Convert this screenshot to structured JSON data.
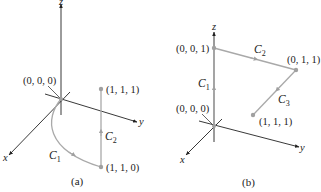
{
  "colors": {
    "axis": "#222222",
    "path": "#a9a9a9",
    "point": "#a0a0a0",
    "text": "#222222"
  },
  "panels": [
    {
      "caption": "(a)",
      "axes": {
        "x": "x",
        "y": "y",
        "z": "z"
      },
      "points": [
        {
          "label": "(0, 0, 0)"
        },
        {
          "label": "(1, 1, 1)"
        },
        {
          "label": "(1, 1, 0)"
        }
      ],
      "curves": [
        {
          "name": "C",
          "sub": "1",
          "description": "curved path from (0, 0, 0) to (1, 1, 0)"
        },
        {
          "name": "C",
          "sub": "2",
          "description": "vertical segment from (1, 1, 0) to (1, 1, 1)"
        }
      ]
    },
    {
      "caption": "(b)",
      "axes": {
        "x": "x",
        "y": "y",
        "z": "z"
      },
      "points": [
        {
          "label": "(0, 0, 1)"
        },
        {
          "label": "(0, 1, 1)"
        },
        {
          "label": "(0, 0, 0)"
        },
        {
          "label": "(1, 1, 1)"
        }
      ],
      "curves": [
        {
          "name": "C",
          "sub": "1",
          "description": "segment from (0, 0, 0) to (0, 0, 1)"
        },
        {
          "name": "C",
          "sub": "2",
          "description": "segment from (0, 0, 1) to (0, 1, 1)"
        },
        {
          "name": "C",
          "sub": "3",
          "description": "segment from (0, 1, 1) to (1, 1, 1)"
        }
      ]
    }
  ]
}
